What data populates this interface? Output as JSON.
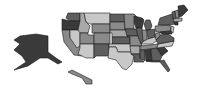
{
  "map": {
    "type": "choropleth",
    "region": "United States",
    "palette": {
      "lightest": "#c8c8c8",
      "light": "#a8a8a8",
      "medium": "#8a8a8a",
      "dark": "#5e5e5e",
      "darkest": "#3a3a3a"
    },
    "states": [
      {
        "id": "WA",
        "shade": "dark",
        "points": "68,13 80,13 80,21 70,21 66,18"
      },
      {
        "id": "OR",
        "shade": "darkest",
        "points": "62,19 70,21 80,21 78,30 62,30"
      },
      {
        "id": "CA",
        "shade": "medium",
        "points": "62,30 70,30 70,38 84,50 82,56 74,55 64,42"
      },
      {
        "id": "ID",
        "shade": "light",
        "points": "80,13 84,13 86,22 90,26 88,33 78,33 78,30 80,21"
      },
      {
        "id": "NV",
        "shade": "lightest",
        "points": "70,30 78,30 80,33 80,46 77,48 70,38"
      },
      {
        "id": "MT",
        "shade": "lightest",
        "points": "84,13 110,13 110,24 90,24 86,22"
      },
      {
        "id": "WY",
        "shade": "medium",
        "points": "92,24 110,24 110,33 92,33"
      },
      {
        "id": "UT",
        "shade": "medium",
        "points": "80,33 88,33 88,35 94,35 94,44 80,44"
      },
      {
        "id": "AZ",
        "shade": "lightest",
        "points": "80,44 94,44 94,58 86,58 78,54 80,48"
      },
      {
        "id": "CO",
        "shade": "medium",
        "points": "94,33 110,33 110,44 94,44"
      },
      {
        "id": "NM",
        "shade": "dark",
        "points": "94,44 109,44 109,56 96,56 94,58"
      },
      {
        "id": "ND",
        "shade": "dark",
        "points": "110,14 124,14 125,22 110,22"
      },
      {
        "id": "SD",
        "shade": "medium",
        "points": "110,22 125,22 125,30 110,30"
      },
      {
        "id": "NE",
        "shade": "light",
        "points": "110,30 126,30 128,37 112,37 112,33 110,33"
      },
      {
        "id": "KS",
        "shade": "dark",
        "points": "112,37 130,37 130,44 112,44"
      },
      {
        "id": "OK",
        "shade": "lightest",
        "points": "109,44 131,44 131,52 118,52 116,47 109,47"
      },
      {
        "id": "TX",
        "shade": "lightest",
        "points": "109,47 116,47 118,52 131,52 134,56 132,64 126,70 122,68 116,60 108,58"
      },
      {
        "id": "MN",
        "shade": "medium",
        "points": "124,14 134,14 138,18 134,22 134,29 125,29"
      },
      {
        "id": "IA",
        "shade": "dark",
        "points": "125,29 136,29 138,36 127,36"
      },
      {
        "id": "MO",
        "shade": "medium",
        "points": "127,36 138,36 142,46 130,46 130,37"
      },
      {
        "id": "AR",
        "shade": "light",
        "points": "130,46 140,46 140,54 131,54"
      },
      {
        "id": "LA",
        "shade": "dark",
        "points": "131,54 140,54 140,58 144,62 134,62 134,56"
      },
      {
        "id": "WI",
        "shade": "darkest",
        "points": "134,16 142,18 144,20 142,28 136,28 134,22"
      },
      {
        "id": "IL",
        "shade": "dark",
        "points": "136,28 142,28 144,40 141,44 138,36"
      },
      {
        "id": "MI",
        "shade": "dark",
        "points": "146,20 150,20 152,26 150,30 146,30 144,24"
      },
      {
        "id": "IN",
        "shade": "medium",
        "points": "142,30 147,30 147,40 143,41"
      },
      {
        "id": "OH",
        "shade": "dark",
        "points": "147,30 155,29 155,37 148,39"
      },
      {
        "id": "KY",
        "shade": "lightest",
        "points": "141,44 144,41 148,39 155,37 158,40 152,44"
      },
      {
        "id": "TN",
        "shade": "medium",
        "points": "140,46 158,44 158,48 140,50"
      },
      {
        "id": "MS",
        "shade": "dark",
        "points": "140,50 145,50 145,61 140,58"
      },
      {
        "id": "AL",
        "shade": "darkest",
        "points": "145,50 151,49 152,61 146,61"
      },
      {
        "id": "GA",
        "shade": "dark",
        "points": "151,49 157,48 162,56 160,61 152,61"
      },
      {
        "id": "FL",
        "shade": "dark",
        "points": "146,61 160,61 164,60 170,70 168,72 160,62 152,62"
      },
      {
        "id": "SC",
        "shade": "darkest",
        "points": "157,48 164,47 168,51 162,56"
      },
      {
        "id": "NC",
        "shade": "lightest",
        "points": "158,44 174,41 172,46 164,47 157,48"
      },
      {
        "id": "VA",
        "shade": "dark",
        "points": "156,40 160,35 168,34 174,38 174,41 158,44"
      },
      {
        "id": "WV",
        "shade": "medium",
        "points": "155,34 160,32 160,36 156,40"
      },
      {
        "id": "PA",
        "shade": "medium",
        "points": "155,26 170,25 171,31 156,32"
      },
      {
        "id": "NY",
        "shade": "dark",
        "points": "160,18 172,14 175,24 170,25 158,25"
      },
      {
        "id": "NJ",
        "shade": "lightest",
        "points": "171,26 174,27 173,33 171,31"
      },
      {
        "id": "MD",
        "shade": "darkest",
        "points": "160,32 171,31 172,34 168,34 162,34"
      },
      {
        "id": "VT",
        "shade": "dark",
        "points": "172,12 175,11 176,18 173,19"
      },
      {
        "id": "NH",
        "shade": "medium",
        "points": "175,11 178,10 179,18 176,18"
      },
      {
        "id": "ME",
        "shade": "darkest",
        "points": "178,6 184,5 188,10 182,16 179,17"
      },
      {
        "id": "MA",
        "shade": "light",
        "points": "173,19 182,18 182,21 174,22"
      },
      {
        "id": "CT",
        "shade": "darkest",
        "points": "174,22 178,22 178,25 175,25"
      },
      {
        "id": "AK",
        "shade": "darkest",
        "points": "20,36 36,34 48,36 48,52 56,58 62,62 58,64 48,58 40,58 28,66 14,70 26,62 22,56 14,50 20,44 14,40"
      },
      {
        "id": "HI",
        "shade": "medium",
        "points": "68,72 72,70 78,73 84,76 92,80 92,84 86,84 82,78 72,74"
      }
    ]
  }
}
